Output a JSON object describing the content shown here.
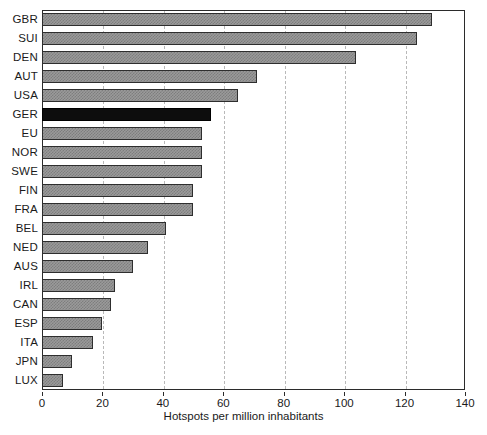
{
  "chart_data": {
    "type": "bar",
    "orientation": "horizontal",
    "title": "",
    "xlabel": "Hotspots per million inhabitants",
    "ylabel": "",
    "xlim": [
      0,
      140
    ],
    "xticks": [
      0,
      20,
      40,
      60,
      80,
      100,
      120,
      140
    ],
    "grid": "vertical-dashed",
    "legend": "none",
    "categories": [
      "GBR",
      "SUI",
      "DEN",
      "AUT",
      "USA",
      "GER",
      "EU",
      "NOR",
      "SWE",
      "FIN",
      "FRA",
      "BEL",
      "NED",
      "AUS",
      "IRL",
      "CAN",
      "ESP",
      "ITA",
      "JPN",
      "LUX"
    ],
    "values": [
      129,
      124,
      104,
      71,
      65,
      56,
      53,
      53,
      53,
      50,
      50,
      41,
      35,
      30,
      24,
      23,
      20,
      17,
      10,
      7
    ],
    "highlight_category": "GER",
    "colors": {
      "bar_fill": "#9a9a9a",
      "bar_edge": "#2e2e2e",
      "highlight_fill": "#0d0d0d",
      "grid": "#b9b9b9",
      "axis": "#2b2b2b",
      "text": "#1a1a1a",
      "background": "#ffffff"
    }
  }
}
